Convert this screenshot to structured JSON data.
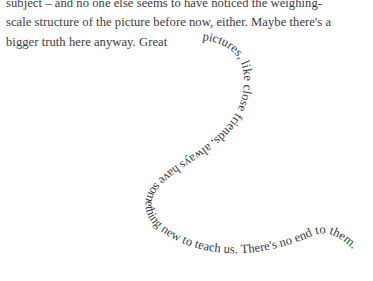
{
  "page": {
    "background_color": "#ffffff",
    "text_color": "#3b3b3f",
    "width": 373,
    "height": 281
  },
  "prose": {
    "lines": [
      "subject – and no one else seems to have noticed the weighing-",
      "scale structure of the picture before now, either. Maybe there's a",
      "bigger truth here anyway.  Great"
    ],
    "line_1": "subject – and no one else seems to have noticed the weighing-",
    "line_2": "scale structure of the picture before now, either. Maybe there's a",
    "line_3": "bigger truth here anyway.  Great"
  },
  "curved_text": {
    "content": "pictures, like close friends, always have something new to teach us. There's no end to them.",
    "shape": "s-curve"
  }
}
